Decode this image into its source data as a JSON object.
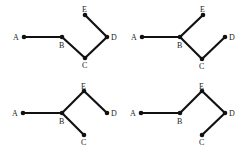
{
  "colors": {
    "line": "#111111",
    "label": "#222222",
    "background": "#ffffff"
  },
  "panels": [
    {
      "id": "panel-1",
      "nodes": {
        "A": {
          "x": 24,
          "y": 37,
          "lx": 13,
          "ly": 40,
          "label": "A"
        },
        "B": {
          "x": 62,
          "y": 37,
          "lx": 59,
          "ly": 48,
          "label": "B"
        },
        "C": {
          "x": 85,
          "y": 58,
          "lx": 82,
          "ly": 68,
          "label": "C"
        },
        "D": {
          "x": 107,
          "y": 37,
          "lx": 111,
          "ly": 40,
          "label": "D"
        },
        "E": {
          "x": 85,
          "y": 15,
          "lx": 82,
          "ly": 12,
          "label": "E"
        }
      },
      "edges": [
        [
          "A",
          "B"
        ],
        [
          "B",
          "C"
        ],
        [
          "C",
          "D"
        ],
        [
          "D",
          "E"
        ]
      ]
    },
    {
      "id": "panel-2",
      "nodes": {
        "A": {
          "x": 142,
          "y": 37,
          "lx": 131,
          "ly": 40,
          "label": "A"
        },
        "B": {
          "x": 180,
          "y": 37,
          "lx": 177,
          "ly": 48,
          "label": "B"
        },
        "C": {
          "x": 202,
          "y": 59,
          "lx": 199,
          "ly": 69,
          "label": "C"
        },
        "D": {
          "x": 225,
          "y": 37,
          "lx": 229,
          "ly": 40,
          "label": "D"
        },
        "E": {
          "x": 203,
          "y": 15,
          "lx": 200,
          "ly": 12,
          "label": "E"
        }
      },
      "edges": [
        [
          "A",
          "B"
        ],
        [
          "B",
          "E"
        ],
        [
          "B",
          "C"
        ],
        [
          "C",
          "D"
        ]
      ]
    },
    {
      "id": "panel-3",
      "nodes": {
        "A": {
          "x": 23,
          "y": 113,
          "lx": 12,
          "ly": 116,
          "label": "A"
        },
        "B": {
          "x": 62,
          "y": 113,
          "lx": 59,
          "ly": 124,
          "label": "B"
        },
        "C": {
          "x": 84,
          "y": 135,
          "lx": 81,
          "ly": 145,
          "label": "C"
        },
        "D": {
          "x": 107,
          "y": 113,
          "lx": 111,
          "ly": 116,
          "label": "D"
        },
        "E": {
          "x": 84,
          "y": 91,
          "lx": 81,
          "ly": 89,
          "label": "E"
        }
      },
      "edges": [
        [
          "A",
          "B"
        ],
        [
          "B",
          "E"
        ],
        [
          "E",
          "D"
        ],
        [
          "B",
          "C"
        ]
      ]
    },
    {
      "id": "panel-4",
      "nodes": {
        "A": {
          "x": 141,
          "y": 113,
          "lx": 130,
          "ly": 116,
          "label": "A"
        },
        "B": {
          "x": 180,
          "y": 113,
          "lx": 177,
          "ly": 124,
          "label": "B"
        },
        "C": {
          "x": 202,
          "y": 135,
          "lx": 199,
          "ly": 145,
          "label": "C"
        },
        "D": {
          "x": 225,
          "y": 113,
          "lx": 229,
          "ly": 116,
          "label": "D"
        },
        "E": {
          "x": 202,
          "y": 91,
          "lx": 199,
          "ly": 89,
          "label": "E"
        }
      },
      "edges": [
        [
          "A",
          "B"
        ],
        [
          "B",
          "E"
        ],
        [
          "E",
          "D"
        ],
        [
          "D",
          "C"
        ]
      ]
    }
  ]
}
